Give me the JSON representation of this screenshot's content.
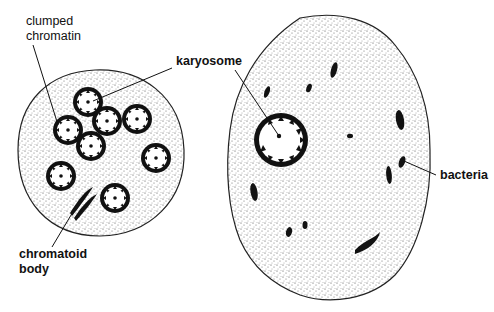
{
  "figure": {
    "left_cell": "cyst",
    "right_cell": "trophozoite",
    "colors": {
      "ink": "#111111",
      "background": "#ffffff",
      "stipple": "#555555"
    }
  },
  "labels": {
    "clumped_chromatin_line1": "clumped",
    "clumped_chromatin_line2": "chromatin",
    "karyosome": "karyosome",
    "bacteria": "bacteria",
    "chromatoid_line1": "chromatoid",
    "chromatoid_line2": "body"
  }
}
